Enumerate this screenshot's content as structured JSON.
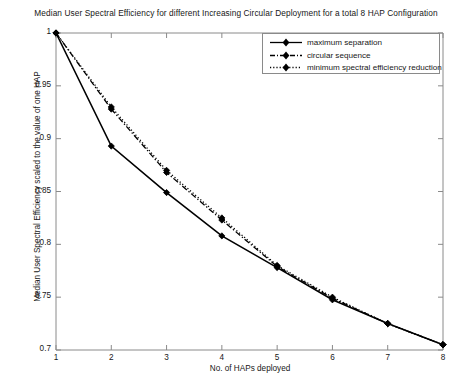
{
  "chart_data": {
    "type": "line",
    "title": "Median User Spectral Efficiency for different Increasing Circular Deployment for a total 8 HAP Configuration",
    "xlabel": "No. of HAPs deployed",
    "ylabel": "Median User Spectral Efficiency scaled to the value of one HAP",
    "x": [
      1,
      2,
      3,
      4,
      5,
      6,
      7,
      8
    ],
    "xlim": [
      1,
      8
    ],
    "ylim": [
      0.7,
      1.0
    ],
    "xticks": [
      "1",
      "2",
      "3",
      "4",
      "5",
      "6",
      "7",
      "8"
    ],
    "yticks": [
      "0.7",
      "0.75",
      "0.8",
      "0.85",
      "0.9",
      "0.95",
      "1"
    ],
    "ytick_values": [
      0.7,
      0.75,
      0.8,
      0.85,
      0.9,
      0.95,
      1.0
    ],
    "grid": false,
    "legend_position": "top-right",
    "series": [
      {
        "name": "maximum separation",
        "values": [
          1.0,
          0.893,
          0.849,
          0.808,
          0.778,
          0.7475,
          0.725,
          0.705
        ],
        "line_style": "solid",
        "marker": "diamond",
        "color": "#000000"
      },
      {
        "name": "circular sequence",
        "values": [
          1.0,
          0.928,
          0.868,
          0.823,
          0.779,
          0.749,
          0.725,
          0.705
        ],
        "line_style": "dash-dot",
        "marker": "diamond",
        "color": "#000000"
      },
      {
        "name": "minimum spectral efficiency reduction",
        "values": [
          1.0,
          0.93,
          0.87,
          0.825,
          0.78,
          0.75,
          0.725,
          0.705
        ],
        "line_style": "dotted",
        "marker": "diamond",
        "color": "#000000"
      }
    ]
  },
  "axes": {
    "color": "#8a8a8a"
  }
}
